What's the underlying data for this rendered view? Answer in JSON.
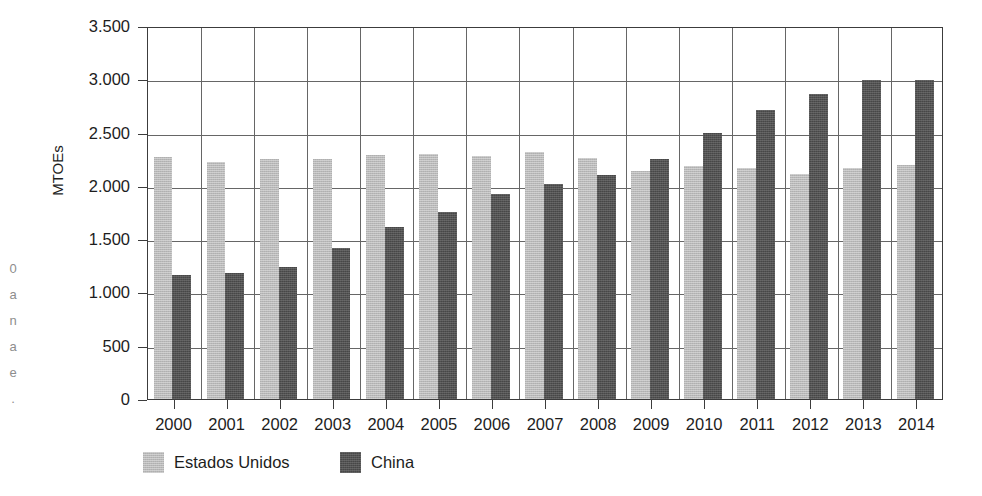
{
  "chart_data": {
    "type": "bar",
    "title": "",
    "subtitle": "",
    "xlabel": "",
    "ylabel": "MTOEs",
    "ylim": [
      0,
      3500
    ],
    "ytick_step": 500,
    "ytick_labels": [
      "0",
      "500",
      "1.000",
      "1.500",
      "2.000",
      "2.500",
      "3.000",
      "3.500"
    ],
    "ytick_values": [
      0,
      500,
      1000,
      1500,
      2000,
      2500,
      3000,
      3500
    ],
    "grid": "horizontal-and-vertical",
    "legend_position": "bottom-left",
    "categories": [
      "2000",
      "2001",
      "2002",
      "2003",
      "2004",
      "2005",
      "2006",
      "2007",
      "2008",
      "2009",
      "2010",
      "2011",
      "2012",
      "2013",
      "2014"
    ],
    "series": [
      {
        "name": "Estados Unidos",
        "color": "#b9b9b9",
        "values": [
          2270,
          2225,
          2250,
          2250,
          2285,
          2300,
          2280,
          2320,
          2260,
          2140,
          2185,
          2165,
          2115,
          2170,
          2195
        ]
      },
      {
        "name": "China",
        "color": "#474747",
        "values": [
          1160,
          1180,
          1235,
          1415,
          1610,
          1755,
          1925,
          2020,
          2100,
          2255,
          2495,
          2715,
          2865,
          2995,
          2990
        ]
      }
    ]
  },
  "legend": {
    "entries": [
      {
        "label": "Estados Unidos",
        "swatch": "us"
      },
      {
        "label": "China",
        "swatch": "cn"
      }
    ]
  },
  "margin_artifact": {
    "lines": [
      "0",
      "a",
      "n",
      "a",
      "e",
      "."
    ]
  }
}
